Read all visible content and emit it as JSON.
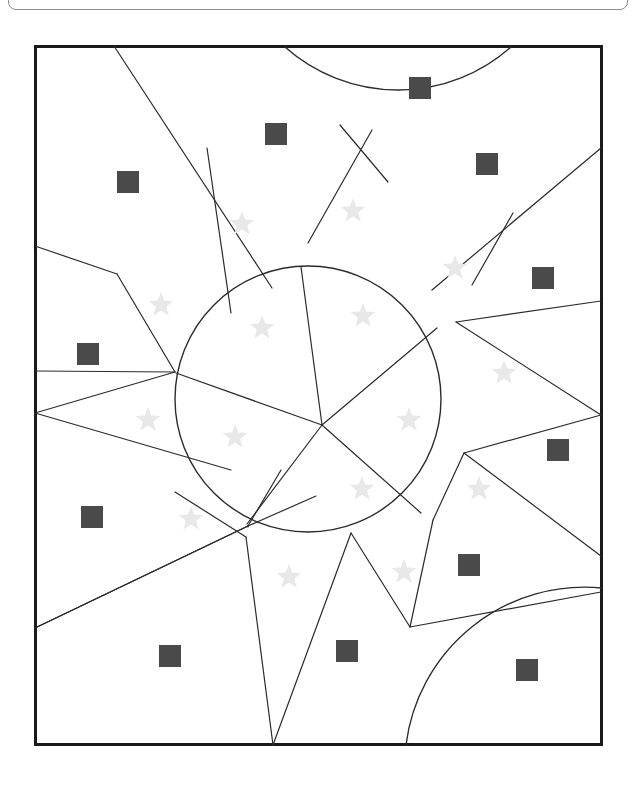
{
  "page": {
    "background_color": "#ffffff",
    "width": 636,
    "height": 785
  },
  "top_bar": {
    "name": "clipped-panel-outline",
    "border_color": "#8d8d8d",
    "visible_text": ""
  },
  "figure": {
    "name": "shape-counting-figure",
    "frame": {
      "x": 34,
      "y": 45,
      "width": 569,
      "height": 701,
      "stroke_color": "#1a1a1a",
      "fill_color": "#ffffff",
      "stroke_width": 3
    },
    "line_color": "#2b2b2b",
    "square_color": "#4a4a4a",
    "star_color": "#e8e8e8",
    "counts": {
      "squares": 12,
      "stars": 17,
      "circles": 1,
      "arcs": 2
    }
  },
  "chart_data": {
    "type": "scatter",
    "subtitle": "",
    "xlabel": "",
    "ylabel": "",
    "xlim": [
      34,
      603
    ],
    "ylim": [
      45,
      746
    ],
    "grid": false,
    "legend": "none",
    "series": [
      {
        "name": "squares",
        "marker": "square",
        "color": "#4a4a4a",
        "count": 12,
        "size": 22,
        "points": [
          {
            "x": 420,
            "y": 88
          },
          {
            "x": 276,
            "y": 134
          },
          {
            "x": 487,
            "y": 164
          },
          {
            "x": 128,
            "y": 182
          },
          {
            "x": 543,
            "y": 278
          },
          {
            "x": 88,
            "y": 354
          },
          {
            "x": 558,
            "y": 450
          },
          {
            "x": 92,
            "y": 517
          },
          {
            "x": 469,
            "y": 565
          },
          {
            "x": 170,
            "y": 656
          },
          {
            "x": 347,
            "y": 651
          },
          {
            "x": 527,
            "y": 670
          }
        ]
      },
      {
        "name": "stars",
        "marker": "star",
        "color": "#e8e8e8",
        "count": 17,
        "size": 26,
        "points": [
          {
            "x": 242,
            "y": 224
          },
          {
            "x": 353,
            "y": 211
          },
          {
            "x": 455,
            "y": 268
          },
          {
            "x": 161,
            "y": 305
          },
          {
            "x": 262,
            "y": 328
          },
          {
            "x": 363,
            "y": 316
          },
          {
            "x": 504,
            "y": 373
          },
          {
            "x": 148,
            "y": 420
          },
          {
            "x": 235,
            "y": 437
          },
          {
            "x": 409,
            "y": 420
          },
          {
            "x": 479,
            "y": 489
          },
          {
            "x": 362,
            "y": 489
          },
          {
            "x": 191,
            "y": 519
          },
          {
            "x": 289,
            "y": 577
          },
          {
            "x": 404,
            "y": 572
          }
        ]
      }
    ],
    "shapes": [
      {
        "type": "circle",
        "cx": 308,
        "cy": 399,
        "r": 133,
        "fill": "none",
        "stroke": "#2b2b2b"
      },
      {
        "type": "arc",
        "name": "top-arc",
        "from": [
          285,
          46
        ],
        "to": [
          510,
          46
        ],
        "sag": 84
      },
      {
        "type": "arc",
        "name": "bottom-right-arc",
        "from": [
          602,
          587
        ],
        "to": [
          405,
          745
        ],
        "sag": 60
      }
    ]
  }
}
